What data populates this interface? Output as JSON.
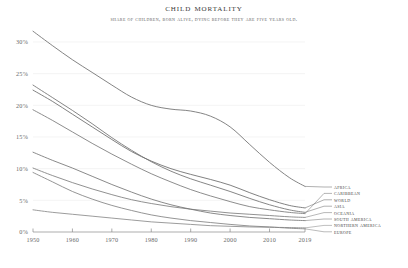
{
  "chart_data": {
    "type": "line",
    "title": "Child Mortality",
    "subtitle": "Share of children, born alive, dying before they are five years old.",
    "xlabel": "",
    "ylabel": "",
    "xlim": [
      1950,
      2019
    ],
    "ylim": [
      0,
      32
    ],
    "grid": true,
    "legend_position": "right",
    "x_ticks": [
      "1950",
      "1960",
      "1970",
      "1980",
      "1990",
      "2000",
      "2010",
      "2019"
    ],
    "x_tick_values": [
      1950,
      1960,
      1970,
      1980,
      1990,
      2000,
      2010,
      2019
    ],
    "y_ticks": [
      "0%",
      "5%",
      "10%",
      "15%",
      "20%",
      "25%",
      "30%"
    ],
    "y_tick_values": [
      0,
      5,
      10,
      15,
      20,
      25,
      30
    ],
    "x": [
      1950,
      1955,
      1960,
      1965,
      1970,
      1975,
      1980,
      1985,
      1990,
      1995,
      2000,
      2005,
      2010,
      2015,
      2019
    ],
    "series": [
      {
        "name": "Africa",
        "color": "#6e6e6e",
        "values": [
          31.7,
          29.4,
          27.2,
          25.2,
          23.2,
          21.3,
          20.0,
          19.4,
          19.1,
          18.3,
          16.6,
          13.8,
          11.0,
          8.6,
          7.2
        ]
      },
      {
        "name": "Caribbean",
        "color": "#787878",
        "values": [
          19.3,
          17.6,
          15.8,
          14.0,
          12.3,
          10.7,
          9.2,
          7.9,
          6.7,
          5.7,
          4.8,
          4.0,
          3.5,
          3.1,
          2.9
        ]
      },
      {
        "name": "World",
        "color": "#6a6a6a",
        "values": [
          22.4,
          20.6,
          18.6,
          16.6,
          14.6,
          12.7,
          11.2,
          10.0,
          9.1,
          8.3,
          7.4,
          6.2,
          5.1,
          4.2,
          3.8
        ]
      },
      {
        "name": "Asia",
        "color": "#707070",
        "values": [
          23.2,
          21.2,
          19.2,
          17.1,
          14.9,
          12.9,
          11.1,
          9.6,
          8.4,
          7.4,
          6.4,
          5.3,
          4.3,
          3.5,
          3.1
        ]
      },
      {
        "name": "Oceania",
        "color": "#7d7d7d",
        "values": [
          10.1,
          8.9,
          7.8,
          6.8,
          5.9,
          5.1,
          4.5,
          4.0,
          3.6,
          3.3,
          3.0,
          2.8,
          2.6,
          2.4,
          2.3
        ]
      },
      {
        "name": "South America",
        "color": "#757575",
        "values": [
          12.6,
          11.3,
          10.1,
          8.8,
          7.5,
          6.3,
          5.2,
          4.3,
          3.6,
          3.0,
          2.6,
          2.3,
          2.1,
          1.9,
          1.8
        ]
      },
      {
        "name": "Northern America",
        "color": "#8a8a8a",
        "values": [
          3.5,
          3.1,
          2.8,
          2.5,
          2.2,
          1.9,
          1.6,
          1.4,
          1.2,
          1.0,
          0.9,
          0.8,
          0.75,
          0.7,
          0.65
        ]
      },
      {
        "name": "Europe",
        "color": "#828282",
        "values": [
          9.4,
          7.9,
          6.4,
          5.2,
          4.2,
          3.4,
          2.7,
          2.2,
          1.8,
          1.5,
          1.2,
          0.95,
          0.8,
          0.6,
          0.5
        ]
      }
    ],
    "legend": [
      {
        "label": "Africa",
        "y_end": 7.2
      },
      {
        "label": "Caribbean",
        "y_end": 2.9
      },
      {
        "label": "World",
        "y_end": 3.8
      },
      {
        "label": "Asia",
        "y_end": 3.1
      },
      {
        "label": "Oceania",
        "y_end": 2.3
      },
      {
        "label": "South America",
        "y_end": 1.8
      },
      {
        "label": "Northern America",
        "y_end": 0.65
      },
      {
        "label": "Europe",
        "y_end": 0.5
      }
    ]
  }
}
